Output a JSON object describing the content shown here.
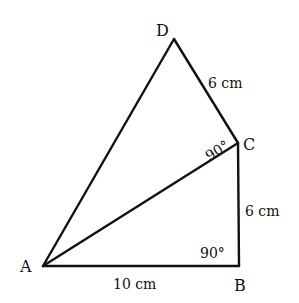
{
  "figure": {
    "vertices": {
      "A": {
        "label": "A",
        "x": 43,
        "y": 266
      },
      "B": {
        "label": "B",
        "x": 239,
        "y": 266
      },
      "C": {
        "label": "C",
        "x": 238,
        "y": 143
      },
      "D": {
        "label": "D",
        "x": 174,
        "y": 39
      }
    },
    "edges": [
      {
        "from": "A",
        "to": "B",
        "label": "10 cm"
      },
      {
        "from": "B",
        "to": "C",
        "label": "6 cm"
      },
      {
        "from": "C",
        "to": "D",
        "label": "6 cm"
      },
      {
        "from": "D",
        "to": "A",
        "label": ""
      },
      {
        "from": "A",
        "to": "C",
        "label": ""
      }
    ],
    "angles": [
      {
        "at": "B",
        "label": "90°"
      },
      {
        "at": "C",
        "label": "90°"
      }
    ]
  }
}
